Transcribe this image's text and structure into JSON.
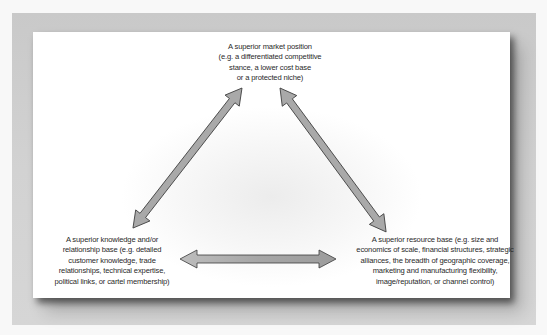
{
  "diagram": {
    "type": "triangle-relationship",
    "nodes": {
      "top": {
        "lines": [
          "A superior market position",
          "(e.g. a differentiated competitive",
          "stance, a lower cost base",
          "or a protected niche)"
        ]
      },
      "left": {
        "lines": [
          "A superior knowledge and/or",
          "relationship base (e.g. detailed",
          "customer knowledge, trade",
          "relationships, technical expertise,",
          "political links, or cartel membership)"
        ]
      },
      "right": {
        "lines": [
          "A superior resource base (e.g. size and",
          "economics of scale, financial structures, strategic",
          "alliances, the breadth of geographic coverage,",
          "marketing and manufacturing flexibility,",
          "image/reputation, or channel control)"
        ]
      }
    },
    "edges": [
      {
        "from": "top",
        "to": "left",
        "style": "double-headed-arrow"
      },
      {
        "from": "top",
        "to": "right",
        "style": "double-headed-arrow"
      },
      {
        "from": "left",
        "to": "right",
        "style": "double-headed-arrow"
      }
    ],
    "colors": {
      "arrow_fill": "#a9a9a9",
      "arrow_stroke": "#3a3a3a",
      "text": "#2a2a2a",
      "frame": "#d0d0d0",
      "card": "#ffffff"
    }
  }
}
